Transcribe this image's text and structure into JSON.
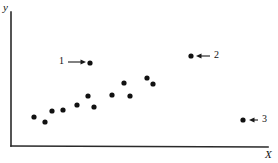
{
  "figure": {
    "background_color": "#ffffff",
    "ink_color": "#1a1a1a",
    "point_color": "#111111",
    "width": 278,
    "height": 163
  },
  "axes": {
    "y_label": "y",
    "x_label": "X",
    "origin": {
      "x": 11,
      "y": 146
    },
    "y_top": {
      "x": 11,
      "y": 12
    },
    "x_right": {
      "x": 268,
      "y": 147
    },
    "axis_line_color": "#2a2a2a"
  },
  "annotations": [
    {
      "name": "annotation-1",
      "label": "1",
      "label_x": 59,
      "label_y": 56,
      "arrow_from_x": 68,
      "arrow_from_y": 62,
      "arrow_to_x": 86,
      "arrow_to_y": 62,
      "direction": "right",
      "target_point_x": 90,
      "target_point_y": 63
    },
    {
      "name": "annotation-2",
      "label": "2",
      "label_x": 214,
      "label_y": 50,
      "arrow_from_x": 210,
      "arrow_from_y": 56,
      "arrow_to_x": 196,
      "arrow_to_y": 56,
      "direction": "left",
      "target_point_x": 191,
      "target_point_y": 56
    },
    {
      "name": "annotation-3",
      "label": "3",
      "label_x": 262,
      "label_y": 114,
      "arrow_from_x": 258,
      "arrow_from_y": 120,
      "arrow_to_x": 249,
      "arrow_to_y": 120,
      "direction": "left",
      "target_point_x": 243,
      "target_point_y": 120
    }
  ],
  "chart_data": {
    "type": "scatter",
    "title": "",
    "subtitle": "",
    "xlabel": "X",
    "ylabel": "y",
    "grid": false,
    "legend": null,
    "axis_ticks": {
      "x": [],
      "y": []
    },
    "xlim": [
      0,
      278
    ],
    "ylim": [
      0,
      163
    ],
    "note": "Pixel coordinates of plotted markers; y measured from top of image. Chart is an unscaled conceptual scatter with three highlighted observations.",
    "series": [
      {
        "name": "main-cluster",
        "marker": "filled-circle",
        "marker_radius_px": 2.6,
        "color": "#111111",
        "points": [
          {
            "x": 34,
            "y": 117
          },
          {
            "x": 45,
            "y": 122
          },
          {
            "x": 52,
            "y": 111
          },
          {
            "x": 63,
            "y": 110
          },
          {
            "x": 77,
            "y": 105
          },
          {
            "x": 88,
            "y": 96
          },
          {
            "x": 94,
            "y": 107
          },
          {
            "x": 112,
            "y": 95
          },
          {
            "x": 124,
            "y": 83
          },
          {
            "x": 130,
            "y": 96
          },
          {
            "x": 147,
            "y": 78
          },
          {
            "x": 153,
            "y": 84
          }
        ]
      },
      {
        "name": "highlighted-observations",
        "marker": "filled-circle",
        "marker_radius_px": 2.6,
        "color": "#111111",
        "points": [
          {
            "x": 90,
            "y": 63,
            "label": "1"
          },
          {
            "x": 191,
            "y": 56,
            "label": "2"
          },
          {
            "x": 243,
            "y": 120,
            "label": "3"
          }
        ]
      }
    ]
  }
}
